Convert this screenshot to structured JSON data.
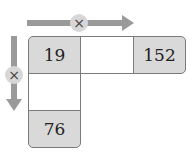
{
  "diagram": {
    "horizontal_operator": "×",
    "vertical_operator": "×",
    "cells": {
      "top_left": "19",
      "top_middle": "",
      "top_right": "152",
      "middle_left": "",
      "bottom_left": "76"
    },
    "colors": {
      "shaded": "#d9d9d9",
      "arrow": "#9a9a9a",
      "border": "#7a7a7a"
    }
  }
}
